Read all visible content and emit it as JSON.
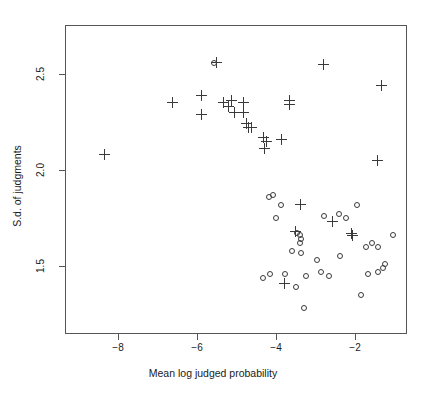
{
  "chart_data": {
    "type": "scatter",
    "title": "",
    "xlabel": "Mean log judged probability",
    "ylabel": "S.d. of judgments",
    "xlim": [
      -9.17,
      -0.52
    ],
    "ylim": [
      1.25,
      2.69
    ],
    "xticks": [
      -8,
      -6,
      -4,
      -2
    ],
    "xticklabels": [
      "−8",
      "−6",
      "−4",
      "−2"
    ],
    "yticks": [
      1.5,
      2.0,
      2.5
    ],
    "yticklabels": [
      "1.5",
      "2.0",
      "2.5"
    ],
    "grid": false,
    "legend": null,
    "series": [
      {
        "name": "plus",
        "marker": "plus",
        "points": [
          [
            -8.35,
            2.08
          ],
          [
            -6.62,
            2.35
          ],
          [
            -5.89,
            2.39
          ],
          [
            -5.89,
            2.29
          ],
          [
            -5.52,
            2.56
          ],
          [
            -5.32,
            2.35
          ],
          [
            -5.21,
            2.33
          ],
          [
            -5.14,
            2.36
          ],
          [
            -4.83,
            2.35
          ],
          [
            -4.83,
            2.3
          ],
          [
            -5.06,
            2.3
          ],
          [
            -4.76,
            2.24
          ],
          [
            -4.71,
            2.22
          ],
          [
            -4.61,
            2.22
          ],
          [
            -4.33,
            2.17
          ],
          [
            -4.23,
            2.15
          ],
          [
            -3.85,
            2.16
          ],
          [
            -4.3,
            2.11
          ],
          [
            -3.65,
            2.36
          ],
          [
            -3.65,
            2.34
          ],
          [
            -2.81,
            2.55
          ],
          [
            -1.32,
            2.44
          ],
          [
            -1.42,
            2.05
          ],
          [
            -3.39,
            1.82
          ],
          [
            -3.52,
            1.68
          ],
          [
            -2.56,
            1.73
          ],
          [
            -2.09,
            1.67
          ],
          [
            -2.06,
            1.66
          ],
          [
            -3.79,
            1.41
          ]
        ]
      },
      {
        "name": "circle",
        "marker": "circle",
        "points": [
          [
            -5.58,
            2.56
          ],
          [
            -4.17,
            1.86
          ],
          [
            -4.07,
            1.87
          ],
          [
            -3.87,
            1.82
          ],
          [
            -4.0,
            1.75
          ],
          [
            -2.79,
            1.76
          ],
          [
            -2.41,
            1.77
          ],
          [
            -1.94,
            1.82
          ],
          [
            -2.24,
            1.75
          ],
          [
            -3.47,
            1.67
          ],
          [
            -3.39,
            1.66
          ],
          [
            -3.37,
            1.64
          ],
          [
            -3.39,
            1.62
          ],
          [
            -3.59,
            1.58
          ],
          [
            -3.37,
            1.57
          ],
          [
            -2.96,
            1.53
          ],
          [
            -1.04,
            1.66
          ],
          [
            -1.42,
            1.6
          ],
          [
            -2.38,
            1.55
          ],
          [
            -1.72,
            1.6
          ],
          [
            -1.57,
            1.62
          ],
          [
            -2.86,
            1.47
          ],
          [
            -4.33,
            1.44
          ],
          [
            -4.15,
            1.46
          ],
          [
            -3.77,
            1.46
          ],
          [
            -3.24,
            1.45
          ],
          [
            -1.67,
            1.46
          ],
          [
            -1.42,
            1.47
          ],
          [
            -1.29,
            1.49
          ],
          [
            -2.66,
            1.45
          ],
          [
            -1.85,
            1.35
          ],
          [
            -3.49,
            1.39
          ],
          [
            -3.29,
            1.28
          ],
          [
            -1.24,
            1.51
          ]
        ]
      }
    ]
  },
  "axis": {
    "x_tick_positions_px": [
      118,
      197,
      276,
      355
    ],
    "y_tick_positions_px": [
      266,
      170,
      74
    ]
  }
}
